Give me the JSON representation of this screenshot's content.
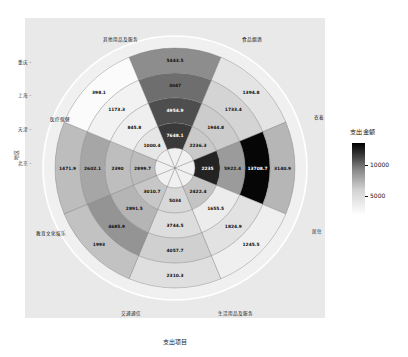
{
  "titles": {
    "x_axis": "支出项目",
    "y_axis": "地区",
    "legend": "支出金额"
  },
  "legend": {
    "ticks": [
      "10000",
      "5000"
    ],
    "low_color": "#f7f7f7",
    "high_color": "#000000"
  },
  "chart_data": {
    "type": "heatmap",
    "layout": "polar",
    "title": "",
    "xlabel": "支出项目",
    "ylabel": "地区",
    "legend_label": "支出金额",
    "legend_ticks": [
      10000,
      5000
    ],
    "categories": [
      "食品烟酒",
      "衣着",
      "居住",
      "生活用品及服务",
      "交通通信",
      "教育文化娱乐",
      "医疗保健",
      "其他用品及服务"
    ],
    "regions": [
      "北京",
      "天津",
      "上海",
      "重庆"
    ],
    "series": [
      {
        "name": "北京",
        "values": [
          7648.1,
          2236.3,
          2235.0,
          2422.4,
          5034.0,
          3010.7,
          2899.7,
          1000.4
        ]
      },
      {
        "name": "天津",
        "values": [
          4954.9,
          1944.8,
          5922.4,
          1655.5,
          3744.5,
          2891.5,
          2390.0,
          845.8
        ]
      },
      {
        "name": "上海",
        "values": [
          3047.0,
          1733.4,
          13708.7,
          1824.9,
          4057.7,
          4685.9,
          2602.1,
          1173.3
        ]
      },
      {
        "name": "重庆",
        "values": [
          5443.5,
          1394.8,
          3140.9,
          1245.5,
          2310.3,
          1993.0,
          1471.9,
          398.1
        ]
      }
    ],
    "cells": [
      {
        "sector": "食品烟酒",
        "ring": "北京",
        "value": 7648.1,
        "color": "#3a3a3a"
      },
      {
        "sector": "食品烟酒",
        "ring": "天津",
        "value": 4954.9,
        "color": "#4e4e4e"
      },
      {
        "sector": "食品烟酒",
        "ring": "上海",
        "value": 3047.0,
        "color": "#6e6e6e"
      },
      {
        "sector": "食品烟酒",
        "ring": "重庆",
        "value": 5443.5,
        "color": "#8d8d8d"
      },
      {
        "sector": "衣着",
        "ring": "北京",
        "value": 2236.3,
        "color": "#c9c9c9"
      },
      {
        "sector": "衣着",
        "ring": "天津",
        "value": 1944.8,
        "color": "#cccccc"
      },
      {
        "sector": "衣着",
        "ring": "上海",
        "value": 1733.4,
        "color": "#d4d4d4"
      },
      {
        "sector": "衣着",
        "ring": "重庆",
        "value": 1394.8,
        "color": "#e4e4e4"
      },
      {
        "sector": "居住",
        "ring": "北京",
        "value": 2235.0,
        "color": "#232323"
      },
      {
        "sector": "居住",
        "ring": "天津",
        "value": 5922.4,
        "color": "#9b9b9b"
      },
      {
        "sector": "居住",
        "ring": "上海",
        "value": 13708.7,
        "color": "#060606"
      },
      {
        "sector": "居住",
        "ring": "重庆",
        "value": 3140.9,
        "color": "#b6b6b6"
      },
      {
        "sector": "生活用品及服务",
        "ring": "北京",
        "value": 2422.4,
        "color": "#c4c4c4"
      },
      {
        "sector": "生活用品及服务",
        "ring": "天津",
        "value": 1655.5,
        "color": "#ececec"
      },
      {
        "sector": "生活用品及服务",
        "ring": "上海",
        "value": 1824.9,
        "color": "#e2e2e2"
      },
      {
        "sector": "生活用品及服务",
        "ring": "重庆",
        "value": 1245.5,
        "color": "#efefef"
      },
      {
        "sector": "交通通信",
        "ring": "北京",
        "value": 5034.0,
        "color": "#d8d8d8"
      },
      {
        "sector": "交通通信",
        "ring": "天津",
        "value": 3744.5,
        "color": "#dddddd"
      },
      {
        "sector": "交通通信",
        "ring": "上海",
        "value": 4057.7,
        "color": "#d0d0d0"
      },
      {
        "sector": "交通通信",
        "ring": "重庆",
        "value": 2310.3,
        "color": "#dfdfdf"
      },
      {
        "sector": "教育文化娱乐",
        "ring": "北京",
        "value": 3010.7,
        "color": "#c7c7c7"
      },
      {
        "sector": "教育文化娱乐",
        "ring": "天津",
        "value": 2891.5,
        "color": "#b5b5b5"
      },
      {
        "sector": "教育文化娱乐",
        "ring": "上海",
        "value": 4685.9,
        "color": "#949494"
      },
      {
        "sector": "教育文化娱乐",
        "ring": "重庆",
        "value": 1993.0,
        "color": "#c2c2c2"
      },
      {
        "sector": "医疗保健",
        "ring": "北京",
        "value": 2899.7,
        "color": "#bcbcbc"
      },
      {
        "sector": "医疗保健",
        "ring": "天津",
        "value": 2390.0,
        "color": "#bebebe"
      },
      {
        "sector": "医疗保健",
        "ring": "上海",
        "value": 2602.1,
        "color": "#a6a6a6"
      },
      {
        "sector": "医疗保健",
        "ring": "重庆",
        "value": 1471.9,
        "color": "#bdbdbd"
      },
      {
        "sector": "其他用品及服务",
        "ring": "北京",
        "value": 1000.4,
        "color": "#e6e6e6"
      },
      {
        "sector": "其他用品及服务",
        "ring": "天津",
        "value": 845.8,
        "color": "#efefef"
      },
      {
        "sector": "其他用品及服务",
        "ring": "上海",
        "value": 1173.3,
        "color": "#f2f2f2"
      },
      {
        "sector": "其他用品及服务",
        "ring": "重庆",
        "value": 398.1,
        "color": "#fbfbfb"
      }
    ],
    "sector_labels": [
      {
        "text": "食品烟酒",
        "x": 242,
        "y": 36
      },
      {
        "text": "其他用品及服务",
        "x": 103,
        "y": 36
      },
      {
        "text": "医疗保健",
        "x": 50,
        "y": 116
      },
      {
        "text": "教育文化娱乐",
        "x": 36,
        "y": 230
      },
      {
        "text": "交通通信",
        "x": 121,
        "y": 310
      },
      {
        "text": "生活用品及服务",
        "x": 218,
        "y": 310
      },
      {
        "text": "居住",
        "x": 312,
        "y": 228
      },
      {
        "text": "衣着",
        "x": 314,
        "y": 114
      }
    ],
    "region_ticks": [
      {
        "text": "重庆",
        "y": 62
      },
      {
        "text": "上海",
        "y": 95
      },
      {
        "text": "天津",
        "y": 129
      },
      {
        "text": "北京",
        "y": 163
      }
    ]
  }
}
